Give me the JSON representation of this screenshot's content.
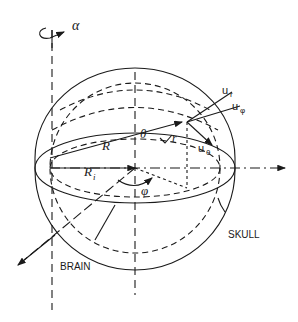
{
  "diagram": {
    "type": "spherical head model with coordinate system",
    "labels": {
      "rotation": "α",
      "outer_radius": "R",
      "inner_radius": "Ri",
      "inner_radius_main": "R",
      "inner_radius_sub": "i",
      "theta": "θ",
      "phi": "φ",
      "r": "r",
      "u_r": "u",
      "u_r_sub": "r",
      "u_phi": "u",
      "u_phi_sub": "φ",
      "u_theta": "u",
      "u_theta_sub": "θ",
      "skull": "SKULL",
      "brain": "BRAIN"
    },
    "colors": {
      "ink": "#1a1a1a",
      "background": "#ffffff"
    }
  }
}
